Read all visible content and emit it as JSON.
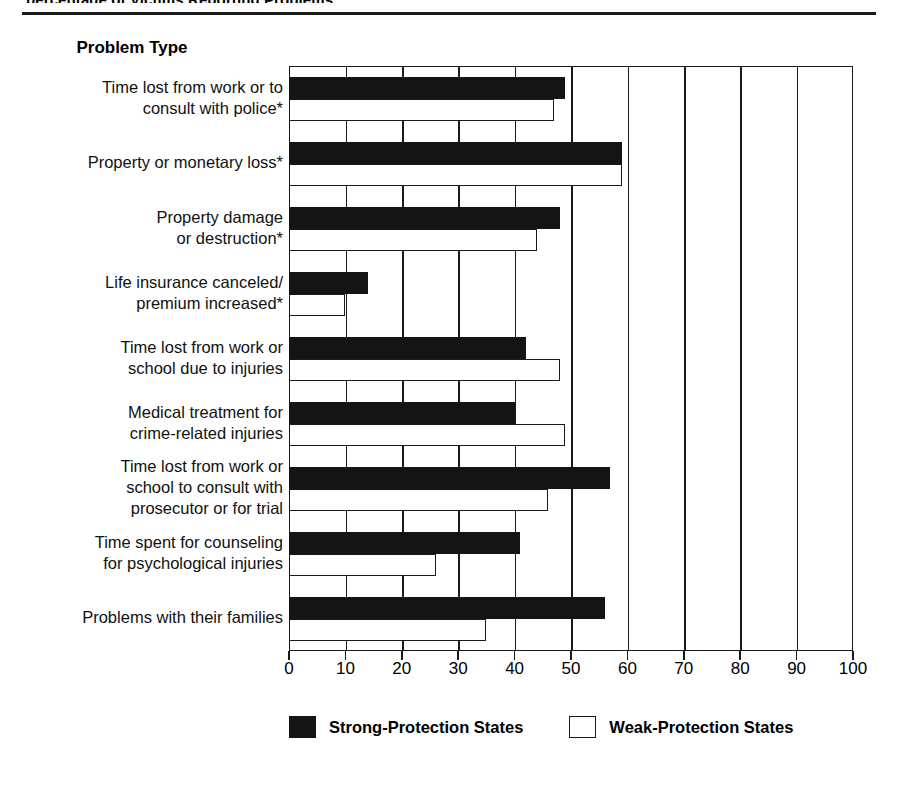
{
  "page": {
    "clipped_caption": "percentage of Victims Reporting Problems",
    "axis_title": "Problem Type"
  },
  "legend": {
    "items": [
      {
        "label": "Strong-Protection States",
        "swatch": "filled-black-square",
        "color": "#141414"
      },
      {
        "label": "Weak-Protection States",
        "swatch": "open-white-square",
        "color": "#ffffff"
      }
    ]
  },
  "chart_data": {
    "type": "bar",
    "orientation": "horizontal",
    "title": "Problem Type",
    "xlabel": "",
    "ylabel": "Problem Type",
    "xlim": [
      0,
      100
    ],
    "xticks": [
      0,
      10,
      20,
      30,
      40,
      50,
      60,
      70,
      80,
      90,
      100
    ],
    "grid": "vertical",
    "legend_position": "bottom",
    "categories": [
      "Time lost from work or to consult with police*",
      "Property or monetary loss*",
      "Property damage or destruction*",
      "Life insurance canceled/ premium increased*",
      "Time lost from work or school due to injuries",
      "Medical treatment for crime-related injuries",
      "Time lost from work or school to consult with prosecutor or for trial",
      "Time spent for counseling for psychological injuries",
      "Problems with their families"
    ],
    "category_lines": [
      [
        "Time lost from work or to",
        "consult with police*"
      ],
      [
        "Property or monetary loss*"
      ],
      [
        "Property damage",
        "or destruction*"
      ],
      [
        "Life insurance canceled/",
        "premium increased*"
      ],
      [
        "Time lost from work or",
        "school due to injuries"
      ],
      [
        "Medical treatment for",
        "crime-related injuries"
      ],
      [
        "Time lost from work or",
        "school to consult with",
        "prosecutor or for trial"
      ],
      [
        "Time spent for counseling",
        "for psychological injuries"
      ],
      [
        "Problems with their families"
      ]
    ],
    "series": [
      {
        "name": "Strong-Protection States",
        "color": "#141414",
        "values": [
          49,
          59,
          48,
          14,
          42,
          40,
          57,
          41,
          56
        ]
      },
      {
        "name": "Weak-Protection States",
        "color": "#ffffff",
        "values": [
          47,
          59,
          44,
          10,
          48,
          49,
          46,
          26,
          35
        ]
      }
    ]
  }
}
